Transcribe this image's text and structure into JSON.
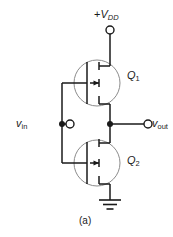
{
  "figure": {
    "kind": "circuit-schematic",
    "caption": "(a)"
  },
  "colors": {
    "background": "#ffffff",
    "wire": "#1a1a1a",
    "device_outline": "#8c8c8c",
    "text": "#1a1a1a"
  },
  "labels": {
    "supply": {
      "prefix": "+",
      "symbol": "V",
      "subscript": "DD"
    },
    "input": {
      "symbol": "v",
      "subscript": "in"
    },
    "output": {
      "symbol": "v",
      "subscript": "out"
    },
    "transistor_top": {
      "symbol": "Q",
      "subscript": "1"
    },
    "transistor_bottom": {
      "symbol": "Q",
      "subscript": "2"
    }
  },
  "terminals": [
    {
      "name": "supply-terminal",
      "x": 110,
      "y": 30,
      "r": 4
    },
    {
      "name": "input-terminal",
      "x": 70,
      "y": 124,
      "r": 4
    },
    {
      "name": "output-terminal",
      "x": 148,
      "y": 124,
      "r": 4
    }
  ],
  "junctions": [
    {
      "name": "input-node",
      "x": 62,
      "y": 124,
      "r": 3
    },
    {
      "name": "output-node",
      "x": 110,
      "y": 124,
      "r": 3
    }
  ],
  "devices": [
    {
      "name": "pmos-q1",
      "cx": 97,
      "cy": 83,
      "r": 23,
      "channel": "p",
      "arrow": "inward"
    },
    {
      "name": "nmos-q2",
      "cx": 97,
      "cy": 163,
      "r": 23,
      "channel": "n",
      "arrow": "inward"
    }
  ],
  "ground": {
    "name": "ground-symbol",
    "x": 110,
    "y_top": 186,
    "bars": [
      {
        "half_width": 11,
        "y": 200
      },
      {
        "half_width": 7,
        "y": 204
      },
      {
        "half_width": 3.5,
        "y": 208
      }
    ]
  }
}
